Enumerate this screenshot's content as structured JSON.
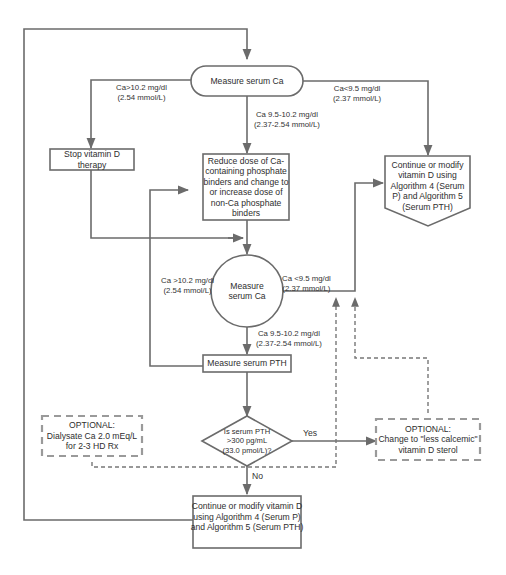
{
  "colors": {
    "line": "#6b6b6b",
    "dashed_border": "#9a9a9a",
    "text": "#2e2e2e",
    "background": "#ffffff"
  },
  "nodes": {
    "measure_ca_top": "Measure serum Ca",
    "stop_vitd": "Stop vitamin D therapy",
    "reduce_binders": "Reduce dose of Ca-\ncontaining phosphate\nbinders and change to\nor increase dose of\nnon-Ca phosphate\nbinders",
    "continue_modify_right": "Continue or modify\nvitamin D using\nAlgorithm 4 (Serum\nP) and Algorithm 5\n(Serum PTH)",
    "measure_ca_circle": "Measure\nserum Ca",
    "measure_pth": "Measure serum PTH",
    "pth_decision": "Is serum PTH\n>300 pg/mL\n(33.0 pmol/L)?",
    "optional_dialysate": "OPTIONAL:\nDialysate Ca 2.0 mEq/L\nfor 2-3 HD Rx",
    "optional_less_calcemic": "OPTIONAL:\nChange to \"less calcemic\"\nvitamin D sterol",
    "continue_modify_bottom": "Continue or modify vitamin D\nusing Algorithm 4 (Serum P)\nand Algorithm 5 (Serum PTH)"
  },
  "edge_labels": {
    "top_high": "Ca>10.2 mg/dl\n(2.54 mmol/L)",
    "top_mid": "Ca 9.5-10.2 mg/dl\n(2.37-2.54 mmol/L)",
    "top_low": "Ca<9.5 mg/dl\n(2.37 mmol/L)",
    "circle_high": "Ca >10.2 mg/dl\n(2.54 mmol/L)",
    "circle_low": "Ca <9.5 mg/dl\n(2.37 mmol/L)",
    "circle_mid": "Ca 9.5-10.2 mg/dl\n(2.37-2.54 mmol/L)",
    "yes": "Yes",
    "no": "No"
  }
}
